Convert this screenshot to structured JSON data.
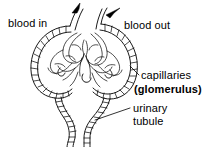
{
  "figure": {
    "background_color": "#ffffff",
    "ink_color": "#000000"
  },
  "labels": {
    "blood_in": "blood in",
    "blood_out": "blood out",
    "capillaries": "capillaries",
    "glomerulus": "(glomerulus)",
    "urinary": "urinary",
    "tubule": "tubule"
  },
  "structures": {
    "capsule_name": "bowmans-capsule",
    "glomerulus_name": "capillary-tuft",
    "tubule_name": "urinary-tubule",
    "afferent_vessel": "afferent-arteriole",
    "efferent_vessel": "efferent-arteriole"
  },
  "annotations": {
    "arrow_in_direction": "up-right",
    "arrow_out_direction": "up-right",
    "leader_capillaries": "from capsule right edge to capillaries label",
    "leader_tubule": "from tubule to urinary tubule label"
  }
}
